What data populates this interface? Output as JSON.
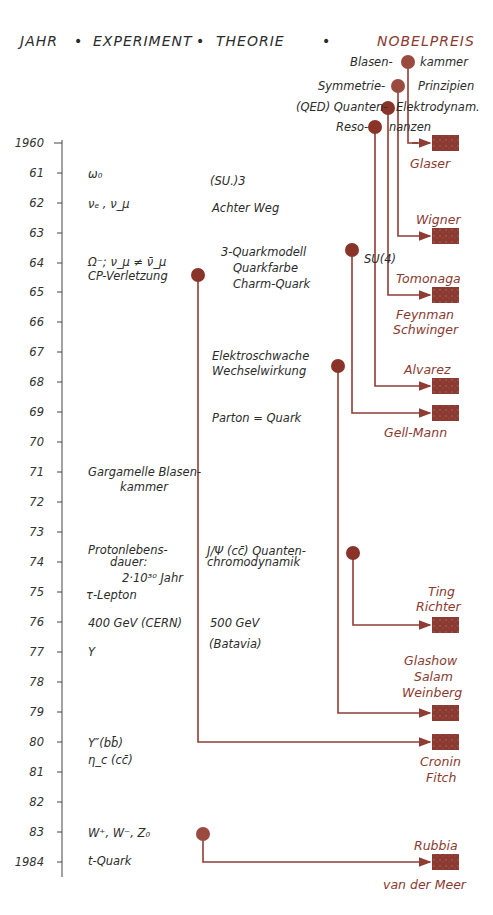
{
  "header": {
    "col_year": "JAHR",
    "col_experiment": "EXPERIMENT",
    "col_theory": "THEORIE",
    "col_nobel": "NOBELPREIS",
    "separator": "•"
  },
  "axis": {
    "years": [
      "1960",
      "61",
      "62",
      "63",
      "64",
      "65",
      "66",
      "67",
      "68",
      "69",
      "70",
      "71",
      "72",
      "73",
      "74",
      "75",
      "76",
      "77",
      "78",
      "79",
      "80",
      "81",
      "82",
      "83",
      "1984"
    ]
  },
  "top_discoveries": {
    "blasenkammer_left": "Blasen-",
    "blasenkammer_right": "kammer",
    "symmetrie_left": "Symmetrie-",
    "symmetrie_right": "Prinzipien",
    "qed_left": "(QED) Quanten-",
    "qed_right": "Elektrodynam.",
    "reso_left": "Reso-",
    "reso_right": "nanzen"
  },
  "experiments": [
    {
      "year": "61",
      "text": "ω₀"
    },
    {
      "year": "62",
      "text": "νₑ , ν_μ"
    },
    {
      "year": "64",
      "text": "Ω⁻; ν_μ ≠ ν̄_μ"
    },
    {
      "year": "64",
      "text": "CP-Verletzung"
    },
    {
      "year": "71",
      "text": "Gargamelle Blasen-"
    },
    {
      "year": "71",
      "text": "kammer"
    },
    {
      "year": "74",
      "text": "Protonlebens-"
    },
    {
      "year": "74",
      "text": "dauer:"
    },
    {
      "year": "74",
      "text": "2·10³⁰ Jahr"
    },
    {
      "year": "75",
      "text": "τ-Lepton"
    },
    {
      "year": "76",
      "text": "400 GeV  (CERN)"
    },
    {
      "year": "77",
      "text": "Υ"
    },
    {
      "year": "80",
      "text": "Υ″(bb̄)"
    },
    {
      "year": "81",
      "text": "η_c (cc̄)"
    },
    {
      "year": "83",
      "text": "W⁺, W⁻, Z₀"
    },
    {
      "year": "1984",
      "text": "t-Quark"
    }
  ],
  "theories": [
    {
      "year": "61",
      "text": "(SU.)3"
    },
    {
      "year": "62",
      "text": "Achter Weg"
    },
    {
      "year": "64",
      "text": "3-Quarkmodell"
    },
    {
      "year": "64",
      "text": "Quarkfarbe"
    },
    {
      "year": "64",
      "text": "Charm-Quark"
    },
    {
      "year": "67",
      "text": "Elektroschwache"
    },
    {
      "year": "67",
      "text": "Wechselwirkung"
    },
    {
      "year": "69",
      "text": "Parton = Quark"
    },
    {
      "year": "74",
      "text": "J/Ψ (cc̄)  Quanten-"
    },
    {
      "year": "74",
      "text": "chromodynamik"
    },
    {
      "year": "76",
      "text": "500 GeV"
    },
    {
      "year": "76",
      "text": "(Batavia)"
    },
    {
      "year": "64",
      "text": "SU(4)"
    }
  ],
  "nobel": [
    {
      "year": "1960",
      "names": "Glaser"
    },
    {
      "year": "1963",
      "names": "Wigner"
    },
    {
      "year": "1965",
      "names_top": "Tomonaga",
      "names_bottom1": "Feynman",
      "names_bottom2": "Schwinger"
    },
    {
      "year": "1968",
      "names": "Alvarez"
    },
    {
      "year": "1969",
      "names": "Gell-Mann"
    },
    {
      "year": "1976",
      "names1": "Ting",
      "names2": "Richter"
    },
    {
      "year": "1979",
      "names1": "Glashow",
      "names2": "Salam",
      "names3": "Weinberg"
    },
    {
      "year": "1980",
      "names1": "Cronin",
      "names2": "Fitch"
    },
    {
      "year": "1984",
      "names_top": "Rubbia",
      "names_bottom": "van der Meer"
    }
  ],
  "colors": {
    "line": "#8f3d34",
    "dot": "#8a3329",
    "box": "#8a3a30",
    "ink": "#2b2b2b"
  }
}
